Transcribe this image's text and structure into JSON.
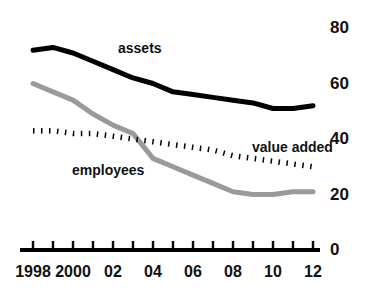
{
  "chart_data": {
    "type": "line",
    "title": "",
    "subtitle": "",
    "xlabel": "",
    "ylabel": "",
    "xlim": [
      1998,
      2012
    ],
    "ylim": [
      0,
      80
    ],
    "grid": false,
    "legend_position": "inline-annotations",
    "y_ticks": [
      "80",
      "60",
      "40",
      "20",
      "0"
    ],
    "y_tick_values": [
      80,
      60,
      40,
      20,
      0
    ],
    "x_ticks": [
      "1998",
      "2000",
      "02",
      "04",
      "06",
      "08",
      "10",
      "12"
    ],
    "x_tick_values": [
      1998,
      2000,
      2002,
      2004,
      2006,
      2008,
      2010,
      2012
    ],
    "x": [
      1998,
      1999,
      2000,
      2001,
      2002,
      2003,
      2004,
      2005,
      2006,
      2007,
      2008,
      2009,
      2010,
      2011,
      2012
    ],
    "series": [
      {
        "name": "assets",
        "label": "assets",
        "color": "#000000",
        "style": "solid-thick",
        "values": [
          72,
          73,
          71,
          68,
          65,
          62,
          60,
          57,
          56,
          55,
          54,
          53,
          51,
          51,
          52
        ]
      },
      {
        "name": "employees",
        "label": "employees",
        "color": "#9a9a9a",
        "style": "solid-gray",
        "values": [
          60,
          57,
          54,
          49,
          45,
          42,
          33,
          30,
          27,
          24,
          21,
          20,
          20,
          21,
          21
        ]
      },
      {
        "name": "value added",
        "label": "value added",
        "color": "#000000",
        "style": "dotted",
        "values": [
          43,
          43,
          42,
          42,
          41,
          40,
          39,
          38,
          37,
          36,
          34,
          33,
          32,
          31,
          30
        ]
      }
    ],
    "annotations": [
      {
        "text": "assets",
        "series": "assets"
      },
      {
        "text": "employees",
        "series": "employees"
      },
      {
        "text": "value added",
        "series": "value added"
      }
    ]
  },
  "colors": {
    "assets": "#000000",
    "employees": "#9a9a9a",
    "value_added": "#000000",
    "axis": "#000000",
    "background": "#ffffff"
  }
}
